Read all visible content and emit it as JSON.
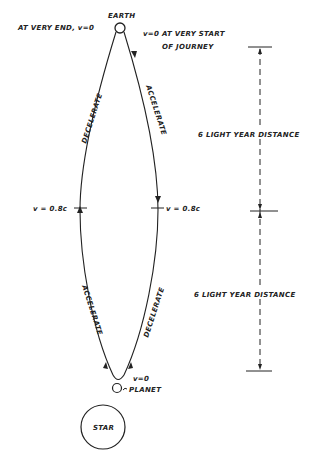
{
  "diagram": {
    "colors": {
      "ink": "#222222",
      "background": "#ffffff"
    },
    "nodes": {
      "earth": {
        "label": "EARTH"
      },
      "planet": {
        "label": "PLANET"
      },
      "star": {
        "label": "STAR"
      }
    },
    "annotations": {
      "end_left": "AT VERY END, v=0",
      "start_line1": "v=0  AT VERY START",
      "start_line2": "OF JOURNEY",
      "left_mid_speed": "v = 0.8c",
      "right_mid_speed": "v = 0.8c",
      "planet_speed": "v=0"
    },
    "path_labels": {
      "left_upper": "DECELERATE",
      "right_upper": "ACCELERATE",
      "left_lower": "ACCELERATE",
      "right_lower": "DECELERATE"
    },
    "distances": {
      "upper": "6 LIGHT YEAR DISTANCE",
      "lower": "6 LIGHT YEAR DISTANCE"
    }
  }
}
